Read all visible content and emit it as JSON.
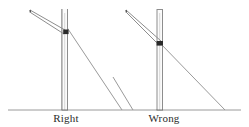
{
  "figure": {
    "background_color": "#ffffff",
    "line_color": "#8d8d8d",
    "dark_line_color": "#5a5a5a",
    "ground_color": "#9a9a9a",
    "node_color": "#2a2a2a",
    "text_color": "#2b2b2b",
    "width": 249,
    "height": 127
  },
  "ground": {
    "label": "ground-line",
    "y": 110,
    "x_start": 8,
    "x_end": 241
  },
  "panels": [
    {
      "id": "right",
      "label": "Right",
      "verdict": "correct",
      "pole": {
        "x_left": 62,
        "x_right": 67,
        "top_y": 9,
        "base_y": 110,
        "cap_y": 13
      },
      "brace": {
        "from_x": 30,
        "from_y": 11,
        "to_x": 64,
        "to_y": 34,
        "thickness": 2
      },
      "junction": {
        "x": 64,
        "y": 32,
        "w": 6,
        "h": 5
      },
      "guy_wire": {
        "anchor_x": 66,
        "anchor_y": 28,
        "ground_x": 122,
        "ground_y": 110
      }
    },
    {
      "id": "wrong",
      "label": "Wrong",
      "verdict": "incorrect",
      "pole": {
        "x_left": 157,
        "x_right": 162,
        "top_y": 9,
        "base_y": 110,
        "cap_y": 13
      },
      "brace": {
        "from_x": 126,
        "from_y": 11,
        "to_x": 159,
        "to_y": 45,
        "thickness": 2
      },
      "junction": {
        "x": 157,
        "y": 42,
        "w": 7,
        "h": 5
      },
      "guy_wire": {
        "anchor_x": 161,
        "anchor_y": 44,
        "ground_x": 225,
        "ground_y": 110
      },
      "secondary_wire": {
        "from_x": 113,
        "from_y": 77,
        "to_x": 133,
        "to_y": 110
      }
    }
  ]
}
